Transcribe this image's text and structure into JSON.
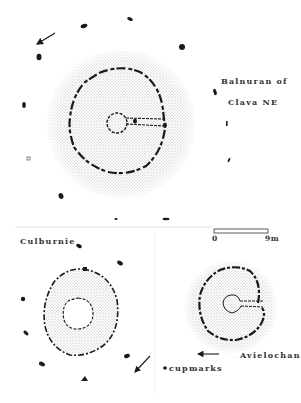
{
  "sites": {
    "balnuaran": {
      "name_line1": "Balnuran of",
      "name_line2": "Clava NE"
    },
    "culburnie": {
      "name": "Culburnie"
    },
    "avielochan": {
      "name": "Avielochan"
    }
  },
  "scale": {
    "start_label": "0",
    "end_label": "9m"
  },
  "legend": {
    "cupmarks_label": "cupmarks"
  },
  "colors": {
    "ink": "#1a1a1a",
    "stipple": "#b8b8b8",
    "paper": "#ffffff"
  }
}
